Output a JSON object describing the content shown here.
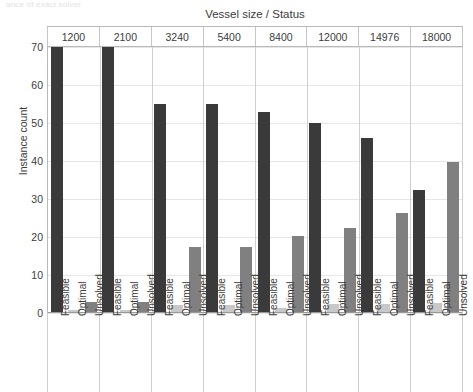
{
  "top_caption": "ance of exact solver",
  "chart_data": {
    "type": "bar",
    "title": "Vessel size / Status",
    "xlabel": "",
    "ylabel": "Instance count",
    "ylim": [
      0,
      70
    ],
    "yticks": [
      0,
      10,
      20,
      30,
      40,
      50,
      60,
      70
    ],
    "grid": true,
    "legend": "none",
    "categories": [
      "1200",
      "2100",
      "3240",
      "5400",
      "8400",
      "12000",
      "14976",
      "18000"
    ],
    "subcategories": [
      "Feasible",
      "Optimal",
      "Unsolved"
    ],
    "series": [
      {
        "name": "Feasible",
        "color": "#3a3a3a",
        "values": [
          70,
          70,
          55,
          55,
          53,
          50,
          46,
          32.5
        ]
      },
      {
        "name": "Optimal",
        "color": "#c8c8c8",
        "values": [
          0.8,
          0.8,
          2,
          2,
          1.4,
          2.4,
          2.4,
          2.6
        ]
      },
      {
        "name": "Unsolved",
        "color": "#808080",
        "values": [
          3,
          3,
          17.5,
          17.5,
          20.3,
          22.3,
          26.3,
          39.7
        ]
      }
    ]
  },
  "colors": {
    "feasible": "#3a3a3a",
    "optimal": "#c8c8c8",
    "unsolved": "#808080",
    "axis": "#9a9a9a",
    "grid": "#e6e6e6",
    "text": "#3c3c3c"
  }
}
